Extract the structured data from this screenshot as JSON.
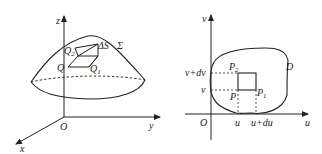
{
  "figure": {
    "left_panel": {
      "description": "Surface Sigma over xyz coordinate system with surface element dS",
      "axes": {
        "z": "z",
        "y": "y",
        "x": "x",
        "origin": "O"
      },
      "surface_label": "Σ",
      "element_label": "ΔS",
      "points": [
        {
          "name": "Q",
          "sub": ""
        },
        {
          "name": "Q",
          "sub": "1"
        },
        {
          "name": "Q",
          "sub": "2"
        }
      ]
    },
    "right_panel": {
      "description": "Parameter region D in uv plane with area element",
      "axes": {
        "v": "v",
        "u": "u",
        "origin": "O"
      },
      "region_label": "D",
      "tick_labels": {
        "u": "u",
        "u_du": "u+du",
        "v": "v",
        "v_dv": "v+dv"
      },
      "points": [
        {
          "name": "P",
          "sub": ""
        },
        {
          "name": "P",
          "sub": "1"
        },
        {
          "name": "P",
          "sub": "2"
        }
      ]
    },
    "colors": {
      "stroke": "#222222",
      "background": "#ffffff"
    }
  }
}
